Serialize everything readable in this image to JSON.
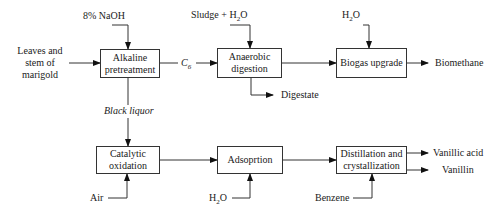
{
  "diagram": {
    "type": "process-flow",
    "nodes": {
      "alkaline": {
        "line1": "Alkaline",
        "line2": "pretreatment"
      },
      "anaerobic": {
        "line1": "Anaerobic",
        "line2": "digestion"
      },
      "biogas": {
        "label": "Biogas upgrade"
      },
      "catalytic": {
        "line1": "Catalytic",
        "line2": "oxidation"
      },
      "adsorption": {
        "label": "Adsoprtion"
      },
      "distillation": {
        "line1": "Distillation and",
        "line2": "crystallization"
      }
    },
    "inputs": {
      "feedstock": {
        "line1": "Leaves and",
        "line2": "stem of",
        "line3": "marigold"
      },
      "naoh": "8% NaOH",
      "sludge": "Sludge + H",
      "sludge_sub": "2",
      "sludge_tail": "O",
      "h2o_biogas": "H",
      "h2o_biogas_sub": "2",
      "h2o_biogas_tail": "O",
      "air": "Air",
      "h2o_ads": "H",
      "h2o_ads_sub": "2",
      "h2o_ads_tail": "O",
      "benzene": "Benzene"
    },
    "intermediates": {
      "c6": "C",
      "c6_sub": "6",
      "black_liquor": "Black liquor"
    },
    "outputs": {
      "digestate": "Digestate",
      "biomethane": "Biomethane",
      "vanillic_acid": "Vanillic acid",
      "vanillin": "Vanillin"
    }
  }
}
